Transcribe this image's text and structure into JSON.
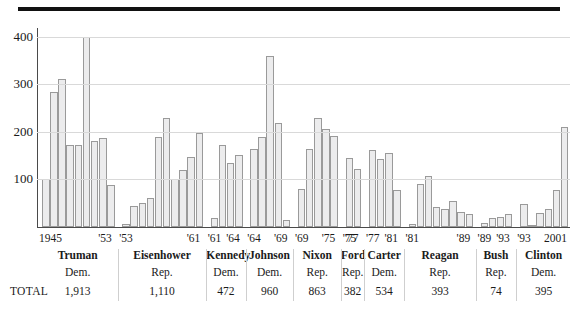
{
  "chart_data": {
    "type": "bar",
    "title": "",
    "xlabel": "",
    "ylabel": "",
    "ylim": [
      0,
      420
    ],
    "yticks": [
      100,
      200,
      300,
      400
    ],
    "ytick_labels": [
      "100",
      "200",
      "300",
      "400"
    ],
    "grid": true,
    "legend": "none",
    "series_name": "Annual count",
    "groups": [
      {
        "president": "Truman",
        "party": "Dem.",
        "total": "1,913",
        "range_start": "1945",
        "range_end": "'53",
        "values": [
          100,
          283,
          311,
          172,
          172,
          400,
          181,
          186,
          88
        ]
      },
      {
        "president": "Eisenhower",
        "party": "Rep.",
        "total": "1,110",
        "range_start": "'53",
        "range_end": "'61",
        "values": [
          6,
          45,
          50,
          62,
          190,
          228,
          100,
          120,
          147,
          198
        ]
      },
      {
        "president": "Kennedy",
        "party": "Dem.",
        "total": "472",
        "range_start": "'61",
        "range_end": "'64",
        "values": [
          20,
          172,
          135,
          152
        ]
      },
      {
        "president": "Johnson",
        "party": "Dem.",
        "total": "960",
        "range_start": "'64",
        "range_end": "'69",
        "values": [
          163,
          190,
          360,
          218,
          15
        ]
      },
      {
        "president": "Nixon",
        "party": "Rep.",
        "total": "863",
        "range_start": "'69",
        "range_end": "'75",
        "values": [
          80,
          163,
          230,
          205,
          192
        ]
      },
      {
        "president": "Ford",
        "party": "Rep.",
        "total": "382",
        "range_start": "'75",
        "range_end": "'77",
        "values": [
          145,
          122
        ]
      },
      {
        "president": "Carter",
        "party": "Dem.",
        "total": "534",
        "range_start": "'77",
        "range_end": "'81",
        "values": [
          162,
          142,
          155,
          78
        ]
      },
      {
        "president": "Reagan",
        "party": "Rep.",
        "total": "393",
        "range_start": "'81",
        "range_end": "'89",
        "values": [
          6,
          90,
          108,
          42,
          38,
          55,
          32,
          28
        ]
      },
      {
        "president": "Bush",
        "party": "Rep.",
        "total": "74",
        "range_start": "'89",
        "range_end": "'93",
        "values": [
          8,
          20,
          22,
          28
        ]
      },
      {
        "president": "Clinton",
        "party": "Dem.",
        "total": "395",
        "range_start": "'93",
        "range_end": "2001",
        "values": [
          48,
          5,
          30,
          38,
          78,
          210
        ]
      }
    ]
  },
  "table": {
    "row_label": "TOTAL"
  },
  "colors": {
    "bar_fill": "#ececed",
    "bar_border": "#9a9a9a",
    "gridline": "#d9d9d9",
    "axis": "#4a4a4a",
    "rule": "#111111",
    "text": "#1a1a1a",
    "separator": "#cfcfcf"
  }
}
